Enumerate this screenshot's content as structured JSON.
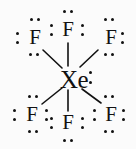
{
  "figure": {
    "formula": "XeF6",
    "background_color": "#fbfbfb",
    "ink_color": "#111111",
    "width": 136,
    "height": 149
  },
  "atoms": {
    "center": {
      "label": "Xe",
      "name": "xenon",
      "x": 57,
      "y": 67,
      "lone_pairs": 1
    },
    "fluorines": [
      {
        "id": "f-top-left",
        "label": "F",
        "name": "fluorine-top-left",
        "x": 26,
        "y": 27
      },
      {
        "id": "f-top-center",
        "label": "F",
        "name": "fluorine-top-center",
        "x": 59,
        "y": 19
      },
      {
        "id": "f-top-right",
        "label": "F",
        "name": "fluorine-top-right",
        "x": 102,
        "y": 27
      },
      {
        "id": "f-bottom-left",
        "label": "F",
        "name": "fluorine-bottom-left",
        "x": 23,
        "y": 104
      },
      {
        "id": "f-bottom-center",
        "label": "F",
        "name": "fluorine-bottom-center",
        "x": 59,
        "y": 112
      },
      {
        "id": "f-bottom-right",
        "label": "F",
        "name": "fluorine-bottom-right",
        "x": 102,
        "y": 104
      }
    ]
  },
  "bonds": [
    {
      "id": "bond-top-left",
      "from": "Xe",
      "to": "F",
      "x1": 62,
      "y1": 68,
      "x2": 43,
      "y2": 50
    },
    {
      "id": "bond-top-center",
      "from": "Xe",
      "to": "F",
      "x1": 68,
      "y1": 66,
      "x2": 68,
      "y2": 43
    },
    {
      "id": "bond-top-right",
      "from": "Xe",
      "to": "F",
      "x1": 80,
      "y1": 67,
      "x2": 98,
      "y2": 50
    },
    {
      "id": "bond-bottom-left",
      "from": "Xe",
      "to": "F",
      "x1": 62,
      "y1": 88,
      "x2": 42,
      "y2": 104
    },
    {
      "id": "bond-bottom-center",
      "from": "Xe",
      "to": "F",
      "x1": 68,
      "y1": 90,
      "x2": 68,
      "y2": 111
    },
    {
      "id": "bond-bottom-right",
      "from": "Xe",
      "to": "F",
      "x1": 82,
      "y1": 89,
      "x2": 101,
      "y2": 103
    }
  ],
  "lone_pair_dots": [
    {
      "group": "xe-right",
      "x": 89,
      "y": 71
    },
    {
      "group": "xe-right",
      "x": 89,
      "y": 81
    },
    {
      "group": "f-top-left-above",
      "x": 30,
      "y": 18
    },
    {
      "group": "f-top-left-above",
      "x": 37,
      "y": 18
    },
    {
      "group": "f-top-left-left",
      "x": 16,
      "y": 32
    },
    {
      "group": "f-top-left-left",
      "x": 16,
      "y": 41
    },
    {
      "group": "f-top-left-below",
      "x": 29,
      "y": 53
    },
    {
      "group": "f-top-left-below",
      "x": 36,
      "y": 53
    },
    {
      "group": "f-top-center-above",
      "x": 63,
      "y": 10
    },
    {
      "group": "f-top-center-above",
      "x": 70,
      "y": 10
    },
    {
      "group": "f-top-center-left",
      "x": 50,
      "y": 24
    },
    {
      "group": "f-top-center-left",
      "x": 50,
      "y": 33
    },
    {
      "group": "f-top-center-right",
      "x": 81,
      "y": 24
    },
    {
      "group": "f-top-center-right",
      "x": 81,
      "y": 33
    },
    {
      "group": "f-top-right-above",
      "x": 104,
      "y": 18
    },
    {
      "group": "f-top-right-above",
      "x": 111,
      "y": 18
    },
    {
      "group": "f-top-right-right",
      "x": 121,
      "y": 32
    },
    {
      "group": "f-top-right-right",
      "x": 121,
      "y": 41
    },
    {
      "group": "f-top-right-below",
      "x": 104,
      "y": 53
    },
    {
      "group": "f-top-right-below",
      "x": 111,
      "y": 53
    },
    {
      "group": "f-bot-left-above",
      "x": 28,
      "y": 95
    },
    {
      "group": "f-bot-left-above",
      "x": 35,
      "y": 95
    },
    {
      "group": "f-bot-left-left",
      "x": 13,
      "y": 109
    },
    {
      "group": "f-bot-left-left",
      "x": 13,
      "y": 118
    },
    {
      "group": "f-bot-left-right",
      "x": 45,
      "y": 109
    },
    {
      "group": "f-bot-left-right",
      "x": 45,
      "y": 118
    },
    {
      "group": "f-bot-left-below",
      "x": 28,
      "y": 130
    },
    {
      "group": "f-bot-left-below",
      "x": 35,
      "y": 130
    },
    {
      "group": "f-bot-center-left",
      "x": 50,
      "y": 117
    },
    {
      "group": "f-bot-center-left",
      "x": 50,
      "y": 126
    },
    {
      "group": "f-bot-center-right",
      "x": 81,
      "y": 117
    },
    {
      "group": "f-bot-center-right",
      "x": 81,
      "y": 126
    },
    {
      "group": "f-bot-center-below",
      "x": 63,
      "y": 139
    },
    {
      "group": "f-bot-center-below",
      "x": 70,
      "y": 139
    },
    {
      "group": "f-bot-right-above",
      "x": 104,
      "y": 95
    },
    {
      "group": "f-bot-right-above",
      "x": 111,
      "y": 95
    },
    {
      "group": "f-bot-right-left",
      "x": 93,
      "y": 109
    },
    {
      "group": "f-bot-right-left",
      "x": 93,
      "y": 118
    },
    {
      "group": "f-bot-right-right",
      "x": 122,
      "y": 109
    },
    {
      "group": "f-bot-right-right",
      "x": 122,
      "y": 118
    },
    {
      "group": "f-bot-right-below",
      "x": 104,
      "y": 130
    },
    {
      "group": "f-bot-right-below",
      "x": 111,
      "y": 130
    }
  ]
}
